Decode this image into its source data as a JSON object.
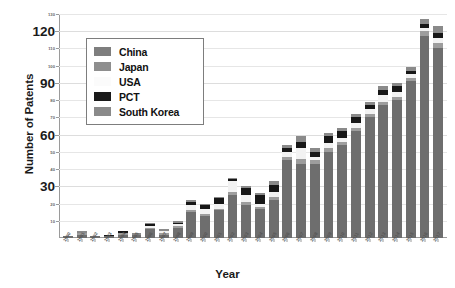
{
  "chart_data": {
    "type": "bar",
    "stacked": true,
    "title": "",
    "xlabel": "Year",
    "ylabel": "Number of Patents",
    "ylim": [
      0,
      130
    ],
    "grid": true,
    "legend_position": "upper-left-inside",
    "y_major_ticks": [
      30,
      60,
      90,
      120
    ],
    "y_minor_ticks": [
      10,
      20,
      40,
      50,
      70,
      80,
      100,
      110,
      130
    ],
    "categories": [
      "1990",
      "1991",
      "1992",
      "1993",
      "1994",
      "1995",
      "1996",
      "1997",
      "1998",
      "1999",
      "2000",
      "2001",
      "2002",
      "2003",
      "2004",
      "2005",
      "2006",
      "2007",
      "2008",
      "2009",
      "2010",
      "2011",
      "2012",
      "2013",
      "2014",
      "2015",
      "2016",
      "2017"
    ],
    "series": [
      {
        "name": "China",
        "color": "#6e6e6e",
        "values": [
          1,
          2,
          1,
          1,
          2,
          2,
          5,
          2,
          6,
          15,
          13,
          16,
          25,
          19,
          17,
          22,
          45,
          43,
          43,
          50,
          54,
          62,
          70,
          77,
          80,
          91,
          117,
          110
        ]
      },
      {
        "name": "Japan",
        "color": "#9d9d9d",
        "values": [
          0,
          1,
          0,
          0,
          1,
          0,
          1,
          1,
          1,
          1,
          1,
          1,
          2,
          2,
          1,
          2,
          2,
          3,
          2,
          2,
          2,
          2,
          2,
          2,
          2,
          2,
          3,
          3
        ]
      },
      {
        "name": "USA",
        "color": "#f2f2f2",
        "values": [
          0,
          0,
          0,
          0,
          0,
          0,
          1,
          1,
          1,
          3,
          3,
          3,
          6,
          4,
          2,
          3,
          3,
          6,
          2,
          3,
          2,
          3,
          3,
          4,
          3,
          2,
          2,
          3
        ]
      },
      {
        "name": "PCT",
        "color": "#171717",
        "values": [
          0,
          0,
          0,
          1,
          1,
          0,
          1,
          0,
          1,
          2,
          2,
          3,
          1,
          4,
          5,
          4,
          2,
          4,
          3,
          4,
          4,
          3,
          2,
          3,
          3,
          2,
          2,
          3
        ]
      },
      {
        "name": "South Korea",
        "color": "#8a8a8a",
        "values": [
          0,
          1,
          0,
          0,
          0,
          1,
          1,
          1,
          1,
          1,
          1,
          1,
          1,
          1,
          1,
          2,
          2,
          3,
          2,
          2,
          2,
          2,
          2,
          2,
          2,
          2,
          3,
          4
        ]
      }
    ],
    "legend_entries": [
      "China",
      "Japan",
      "USA",
      "PCT",
      "South Korea"
    ]
  }
}
